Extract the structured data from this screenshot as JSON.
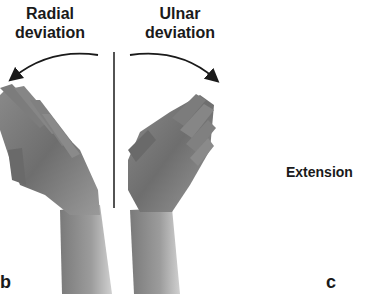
{
  "figure": {
    "panel_b": {
      "letter": "b",
      "left_label_line1": "Radial",
      "left_label_line2": "deviation",
      "right_label_line1": "Ulnar",
      "right_label_line2": "deviation"
    },
    "panel_c": {
      "letter": "c",
      "label": "Extension"
    }
  }
}
